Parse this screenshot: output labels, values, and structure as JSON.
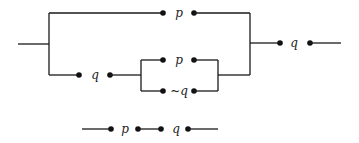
{
  "diagram": {
    "type": "switching-circuit",
    "colors": {
      "wire": "#1a1a1a",
      "background": "#ffffff"
    },
    "main_circuit": {
      "top_branch": {
        "switch_label": "p"
      },
      "bottom_branch": {
        "series_switch_label": "q",
        "parallel_upper_label": "p",
        "parallel_lower_label": "~q"
      },
      "output_switch_label": "q"
    },
    "simplified_circuit": {
      "switch_1_label": "p",
      "switch_2_label": "q"
    }
  }
}
